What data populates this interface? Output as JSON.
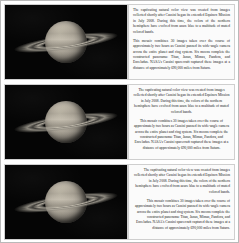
{
  "document": {
    "title": "Cassini Saturn Natural Color Mosaic",
    "panel_count": 3,
    "background_color": "#ffffff",
    "border_color": "#b9b9b9"
  },
  "caption": {
    "paragraph_1": "The captivating natural color view was created from images collected shortly after Cassini began its extended Equinox Mission in July 2008. During this time, the colors of the northern hemisphere have evolved from azure blue to a multitude of muted colored bands.",
    "paragraph_2": "This mosaic combines 30 images taken over the course of approximately two hours as Cassini panned its wide-angle camera across the entire planet and ring system. Six moons complete the constructed panorama: Titan, Janus, Mimas, Pandora, and Enceladus. NASA's Cassini spacecraft captured these images at a distance of approximately 690,000 miles from Saturn."
  },
  "panels": [
    {
      "name": "panel-one",
      "image_alt": "Saturn with rings, natural color mosaic",
      "text_alignment": "justify",
      "image_background": "#050505"
    },
    {
      "name": "panel-two",
      "image_alt": "Saturn with rings, natural color mosaic",
      "text_alignment": "center",
      "image_background": "#050505"
    },
    {
      "name": "panel-three",
      "image_alt": "Saturn with rings, natural color mosaic",
      "text_alignment": "right",
      "image_background": "#050505"
    }
  ],
  "colors": {
    "planet_highlight": "#c9c2b2",
    "planet_midtone": "#8f897e",
    "ring_bright": "#c4beb0",
    "text_color": "#1a1a1a",
    "pane_background": "#fbfbfb",
    "pane_border": "#cfcfcf"
  }
}
